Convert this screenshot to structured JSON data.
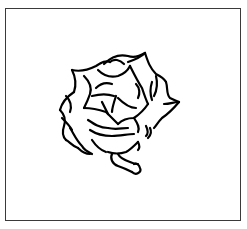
{
  "figure": {
    "caption": "",
    "colors": {
      "stroke": "#000000",
      "border": "#3a3a3a",
      "background": "#ffffff"
    }
  }
}
